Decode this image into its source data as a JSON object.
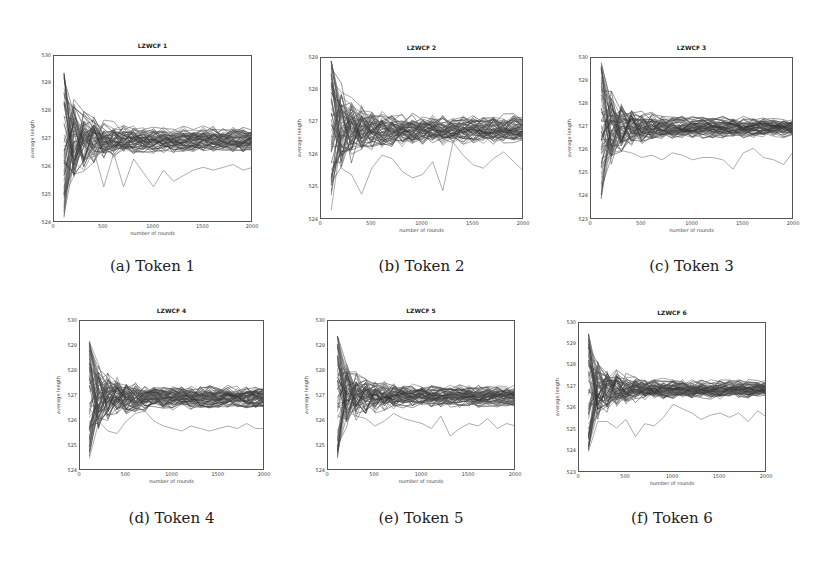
{
  "figure": {
    "captions": [
      "(a) Token 1",
      "(b) Token 2",
      "(c) Token 3",
      "(d) Token 4",
      "(e) Token 5",
      "(f) Token 6"
    ]
  },
  "chart_data": [
    {
      "type": "line",
      "title": "LZWCF 1",
      "caption": "(a) Token 1",
      "xlabel": "number of rounds",
      "ylabel": "average length",
      "xlim": [
        0,
        2000
      ],
      "ylim": [
        524,
        530
      ],
      "xticks": [
        "0",
        "500",
        "1000",
        "1500",
        "2000"
      ],
      "yticks": [
        "524",
        "525",
        "526",
        "527",
        "528",
        "529",
        "530"
      ],
      "grid": false,
      "legend": null,
      "series_count_approx": 60,
      "x": [
        100,
        200,
        300,
        400,
        500,
        600,
        700,
        800,
        900,
        1000,
        1100,
        1200,
        1300,
        1400,
        1500,
        1600,
        1700,
        1800,
        1900,
        2000
      ],
      "converged_mean": 527.0,
      "converged_band": [
        526.6,
        527.4
      ],
      "initial_spread": [
        524.2,
        529.4
      ],
      "outlier_series": [
        {
          "name": "outlier",
          "values": [
            526.8,
            526.2,
            525.9,
            526.6,
            525.3,
            526.5,
            525.3,
            526.3,
            525.8,
            525.3,
            525.9,
            525.5,
            525.7,
            525.9,
            526.0,
            525.9,
            526.0,
            526.1,
            525.9,
            526.0
          ]
        }
      ]
    },
    {
      "type": "line",
      "title": "LZWCF 2",
      "caption": "(b) Token 2",
      "xlabel": "number of rounds",
      "ylabel": "average length",
      "xlim": [
        0,
        2000
      ],
      "ylim": [
        524,
        529
      ],
      "xticks": [
        "0",
        "500",
        "1000",
        "1500",
        "2000"
      ],
      "yticks": [
        "524",
        "525",
        "526",
        "527",
        "528",
        "529"
      ],
      "grid": false,
      "legend": null,
      "series_count_approx": 60,
      "x": [
        100,
        200,
        300,
        400,
        500,
        600,
        700,
        800,
        900,
        1000,
        1100,
        1200,
        1300,
        1400,
        1500,
        1600,
        1700,
        1800,
        1900,
        2000
      ],
      "converged_mean": 526.8,
      "converged_band": [
        526.4,
        527.2
      ],
      "initial_spread": [
        524.3,
        528.9
      ],
      "outlier_series": [
        {
          "name": "outlier",
          "values": [
            526.5,
            525.6,
            525.4,
            524.8,
            525.6,
            526.0,
            525.9,
            525.5,
            525.3,
            525.4,
            525.8,
            524.9,
            526.4,
            526.0,
            525.7,
            525.6,
            525.9,
            526.1,
            525.8,
            525.5
          ]
        }
      ]
    },
    {
      "type": "line",
      "title": "LZWCF 3",
      "caption": "(c) Token 3",
      "xlabel": "number of rounds",
      "ylabel": "average length",
      "xlim": [
        0,
        2000
      ],
      "ylim": [
        523,
        530
      ],
      "xticks": [
        "0",
        "500",
        "1000",
        "1500",
        "2000"
      ],
      "yticks": [
        "523",
        "524",
        "525",
        "526",
        "527",
        "528",
        "529",
        "530"
      ],
      "grid": false,
      "legend": null,
      "series_count_approx": 60,
      "x": [
        100,
        200,
        300,
        400,
        500,
        600,
        700,
        800,
        900,
        1000,
        1100,
        1200,
        1300,
        1400,
        1500,
        1600,
        1700,
        1800,
        1900,
        2000
      ],
      "converged_mean": 527.0,
      "converged_band": [
        526.6,
        527.4
      ],
      "initial_spread": [
        523.9,
        529.8
      ],
      "outlier_series": [
        {
          "name": "outlier",
          "values": [
            526.3,
            525.9,
            526.0,
            525.9,
            525.7,
            525.8,
            525.6,
            525.9,
            525.8,
            525.6,
            525.7,
            525.7,
            525.6,
            525.2,
            525.9,
            526.1,
            525.7,
            525.6,
            525.4,
            526.0
          ]
        }
      ]
    },
    {
      "type": "line",
      "title": "LZWCF 4",
      "caption": "(d) Token 4",
      "xlabel": "number of rounds",
      "ylabel": "average length",
      "xlim": [
        0,
        2000
      ],
      "ylim": [
        524,
        530
      ],
      "xticks": [
        "0",
        "500",
        "1000",
        "1500",
        "2000"
      ],
      "yticks": [
        "524",
        "525",
        "526",
        "527",
        "528",
        "529",
        "530"
      ],
      "grid": false,
      "legend": null,
      "series_count_approx": 60,
      "x": [
        100,
        200,
        300,
        400,
        500,
        600,
        700,
        800,
        900,
        1000,
        1100,
        1200,
        1300,
        1400,
        1500,
        1600,
        1700,
        1800,
        1900,
        2000
      ],
      "converged_mean": 526.95,
      "converged_band": [
        526.5,
        527.3
      ],
      "initial_spread": [
        524.5,
        529.2
      ],
      "outlier_series": [
        {
          "name": "outlier",
          "values": [
            526.5,
            526.0,
            525.6,
            525.5,
            526.0,
            526.3,
            526.4,
            526.0,
            525.8,
            525.7,
            525.6,
            525.8,
            525.7,
            525.6,
            525.7,
            525.8,
            525.7,
            525.9,
            525.7,
            525.7
          ]
        }
      ]
    },
    {
      "type": "line",
      "title": "LZWCF 5",
      "caption": "(e) Token 5",
      "xlabel": "number of rounds",
      "ylabel": "average length",
      "xlim": [
        0,
        2000
      ],
      "ylim": [
        524,
        530
      ],
      "xticks": [
        "0",
        "500",
        "1000",
        "1500",
        "2000"
      ],
      "yticks": [
        "524",
        "525",
        "526",
        "527",
        "528",
        "529",
        "530"
      ],
      "grid": false,
      "legend": null,
      "series_count_approx": 60,
      "x": [
        100,
        200,
        300,
        400,
        500,
        600,
        700,
        800,
        900,
        1000,
        1100,
        1200,
        1300,
        1400,
        1500,
        1600,
        1700,
        1800,
        1900,
        2000
      ],
      "converged_mean": 527.0,
      "converged_band": [
        526.6,
        527.4
      ],
      "initial_spread": [
        524.5,
        529.4
      ],
      "outlier_series": [
        {
          "name": "outlier",
          "values": [
            526.6,
            526.4,
            526.2,
            526.1,
            525.8,
            526.0,
            526.3,
            526.1,
            526.0,
            525.9,
            525.7,
            526.2,
            525.4,
            525.7,
            525.9,
            525.8,
            526.1,
            525.7,
            525.9,
            525.8
          ]
        }
      ]
    },
    {
      "type": "line",
      "title": "LZWCF 6",
      "caption": "(f) Token 6",
      "xlabel": "number of rounds",
      "ylabel": "average length",
      "xlim": [
        0,
        2000
      ],
      "ylim": [
        523,
        530
      ],
      "xticks": [
        "0",
        "500",
        "1000",
        "1500",
        "2000"
      ],
      "yticks": [
        "523",
        "524",
        "525",
        "526",
        "527",
        "528",
        "529",
        "530"
      ],
      "grid": false,
      "legend": null,
      "series_count_approx": 60,
      "x": [
        100,
        200,
        300,
        400,
        500,
        600,
        700,
        800,
        900,
        1000,
        1100,
        1200,
        1300,
        1400,
        1500,
        1600,
        1700,
        1800,
        1900,
        2000
      ],
      "converged_mean": 526.9,
      "converged_band": [
        526.5,
        527.3
      ],
      "initial_spread": [
        523.9,
        529.5
      ],
      "outlier_series": [
        {
          "name": "outlier",
          "values": [
            524.0,
            525.4,
            525.4,
            525.1,
            525.5,
            524.7,
            525.3,
            525.2,
            525.6,
            526.2,
            526.0,
            525.8,
            525.5,
            525.7,
            525.8,
            525.6,
            525.8,
            525.4,
            525.9,
            525.6
          ]
        }
      ]
    }
  ]
}
